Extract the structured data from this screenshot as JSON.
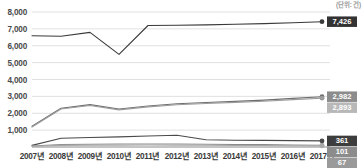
{
  "corner_note": "(단위: 건)",
  "chart_data": {
    "type": "line",
    "title": "",
    "subtitle": "",
    "xlabel": "",
    "ylabel": "",
    "grid": true,
    "legend_position": "none",
    "ylim": [
      0,
      8000
    ],
    "yticks": [
      1000,
      2000,
      3000,
      4000,
      5000,
      6000,
      7000,
      8000
    ],
    "ytick_labels": [
      "1,000",
      "2,000",
      "3,000",
      "4,000",
      "5,000",
      "6,000",
      "7,000",
      "8,000"
    ],
    "categories": [
      "2007년",
      "2008년",
      "2009년",
      "2010년",
      "2011년",
      "2012년",
      "2013년",
      "2014년",
      "2015년",
      "2016년",
      "2017년"
    ],
    "series": [
      {
        "name": "series-top",
        "color": "#3a3a3a",
        "end_label": "7,426",
        "end_label_bg": "#333333",
        "end_label_fg": "#ffffff",
        "values": [
          6590,
          6560,
          6790,
          5490,
          7200,
          7215,
          7240,
          7275,
          7310,
          7360,
          7426
        ]
      },
      {
        "name": "series-mid-upper",
        "color": "#6e6e6e",
        "end_label": "2,982",
        "end_label_bg": "#8c8c8c",
        "end_label_fg": "#ffffff",
        "values": [
          1230,
          2300,
          2510,
          2250,
          2430,
          2560,
          2640,
          2705,
          2780,
          2880,
          2982
        ]
      },
      {
        "name": "series-mid-lower",
        "color": "#9b9b9b",
        "end_label": "2,893",
        "end_label_bg": "#b8b8b8",
        "end_label_fg": "#ffffff",
        "values": [
          1180,
          2250,
          2460,
          2200,
          2380,
          2505,
          2580,
          2645,
          2715,
          2805,
          2893
        ]
      },
      {
        "name": "series-low-upper",
        "color": "#4a4a4a",
        "end_label": "361",
        "end_label_bg": "#3d3d3d",
        "end_label_fg": "#ffffff",
        "values": [
          95,
          520,
          560,
          600,
          650,
          700,
          430,
          400,
          390,
          375,
          361
        ]
      },
      {
        "name": "series-low-mid",
        "color": "#8a8a8a",
        "end_label": "101",
        "end_label_bg": "#8c8c8c",
        "end_label_fg": "#ffffff",
        "values": [
          60,
          150,
          165,
          175,
          180,
          175,
          160,
          150,
          140,
          120,
          101
        ]
      },
      {
        "name": "series-low-bottom",
        "color": "#a8a8a8",
        "end_label": "67",
        "end_label_bg": "#9a9a9a",
        "end_label_fg": "#ffffff",
        "values": [
          40,
          95,
          105,
          110,
          115,
          110,
          100,
          92,
          85,
          75,
          67
        ]
      }
    ]
  }
}
